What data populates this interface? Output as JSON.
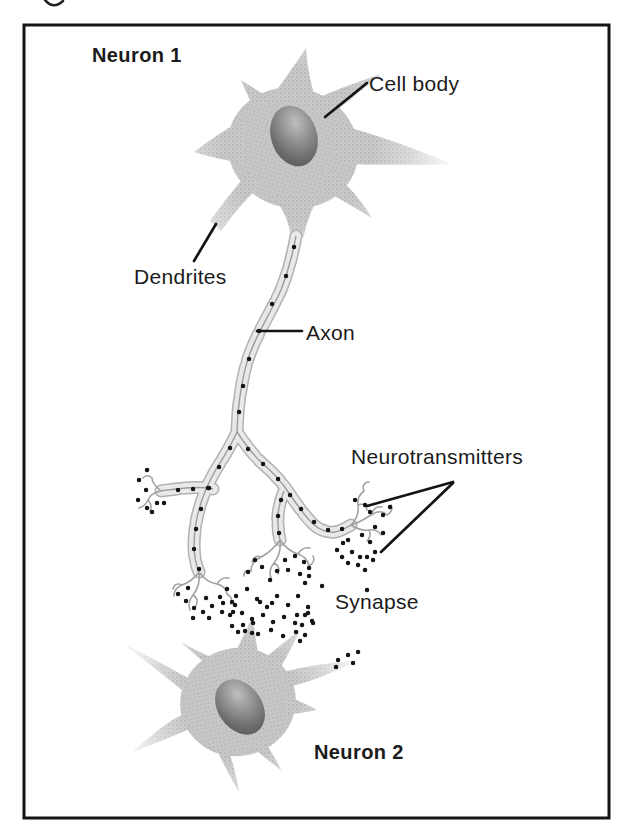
{
  "figure": {
    "labels": {
      "neuron1": "Neuron 1",
      "cell_body": "Cell body",
      "dendrites": "Dendrites",
      "axon": "Axon",
      "neurotransmitters": "Neurotransmitters",
      "synapse": "Synapse",
      "neuron2": "Neuron 2"
    },
    "colors": {
      "background": "#ffffff",
      "frame_border": "#141414",
      "label_text": "#1b1b1b",
      "cell_body_fill": "#c9c9c9",
      "nucleus_dark": "#4c4c4c",
      "myelin_fill": "#e9e9e9",
      "myelin_outline": "#b2b2b2",
      "neurotransmitter_dot": "#151515"
    }
  }
}
